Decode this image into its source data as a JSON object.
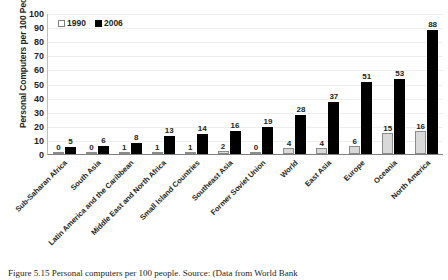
{
  "chart_data": {
    "type": "bar",
    "title": "",
    "xlabel": "",
    "ylabel": "Personal Computers per 100 People",
    "ylim": [
      0,
      100
    ],
    "ytick_step": 10,
    "yticks": [
      100,
      90,
      80,
      70,
      60,
      50,
      40,
      30,
      20,
      10,
      0
    ],
    "grid": true,
    "legend_position": "top-left",
    "categories": [
      "Sub-Saharan Africa",
      "South Asia",
      "Latin America and the Caribbean",
      "Middle East and North Africa",
      "Small Island Countries",
      "Southeast Asia",
      "Former Soviet Union",
      "World",
      "East Asia",
      "Europe",
      "Oceania",
      "North America"
    ],
    "series": [
      {
        "name": "1990",
        "color": "#d9d9d9",
        "values": [
          0,
          0,
          1,
          1,
          1,
          2,
          0,
          4,
          4,
          6,
          15,
          16
        ]
      },
      {
        "name": "2006",
        "color": "#000000",
        "values": [
          5,
          6,
          8,
          13,
          14,
          16,
          19,
          28,
          37,
          51,
          53,
          88
        ]
      }
    ]
  },
  "legend": {
    "items": [
      {
        "label": "1990"
      },
      {
        "label": "2006"
      }
    ]
  },
  "caption": {
    "text": "Figure 5.15   Personal computers per 100 people.  Source: (Data from World Bank"
  }
}
